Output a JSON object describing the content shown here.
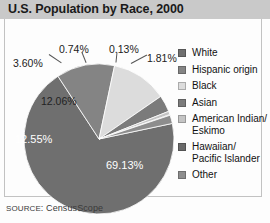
{
  "chart_title": "U.S. Population by Race, 2000",
  "source_prefix": "SOURCE",
  "source_text": ": CensusScope",
  "legend": {
    "items": [
      {
        "label": "White",
        "color": "#6f6f6f"
      },
      {
        "label": "Hispanic origin",
        "color": "#848484"
      },
      {
        "label": "Black",
        "color": "#dcdcdc"
      },
      {
        "label": "Asian",
        "color": "#7b7b7b"
      },
      {
        "label": "American Indian/\nEskimo",
        "color": "#c4c4c4"
      },
      {
        "label": "Hawaiian/\nPacific Islander",
        "color": "#6a6a6a"
      },
      {
        "label": "Other",
        "color": "#8d8d8d"
      }
    ]
  },
  "labels": {
    "white": "69.13%",
    "hispanic": "12.55%",
    "black": "12.06%",
    "asian": "3.60%",
    "aian": "0.74%",
    "nhpi": "0.13%",
    "other": "1.81%"
  },
  "chart_data": {
    "type": "pie",
    "title": "U.S. Population by Race, 2000",
    "xlabel": "",
    "ylabel": "",
    "units": "percent",
    "total": 100,
    "legend_position": "right",
    "grid": false,
    "start_angle_deg": -12,
    "direction": "clockwise",
    "categories": [
      "White",
      "Hispanic origin",
      "Black",
      "Asian",
      "American Indian/Eskimo",
      "Hawaiian/Pacific Islander",
      "Other"
    ],
    "values": [
      69.13,
      12.55,
      12.06,
      3.6,
      0.74,
      0.13,
      1.81
    ],
    "data_labels": [
      "69.13%",
      "12.55%",
      "12.06%",
      "3.60%",
      "0.74%",
      "0.13%",
      "1.81%"
    ],
    "colors": [
      "#6f6f6f",
      "#848484",
      "#dcdcdc",
      "#7b7b7b",
      "#c4c4c4",
      "#6a6a6a",
      "#8d8d8d"
    ],
    "annotations": [
      "SOURCE: CensusScope"
    ]
  }
}
